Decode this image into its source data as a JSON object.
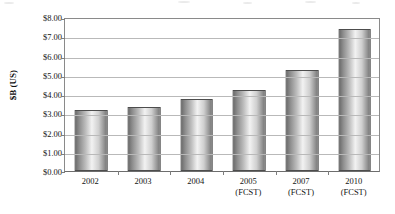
{
  "chart_data": {
    "type": "bar",
    "title": "",
    "subtitle": "",
    "xlabel": "",
    "ylabel": "$B (US)",
    "categories": [
      "2002",
      "2003",
      "2004",
      "2005",
      "2007",
      "2010"
    ],
    "category_sublabels": [
      "",
      "",
      "",
      "(FCST)",
      "(FCST)",
      "(FCST)"
    ],
    "values": [
      3.15,
      3.35,
      3.75,
      4.2,
      5.25,
      7.4
    ],
    "ylim": [
      0,
      8
    ],
    "ytick_step": 1,
    "ytick_labels": [
      "$0.00",
      "$1.00",
      "$2.00",
      "$3.00",
      "$4.00",
      "$5.00",
      "$6.00",
      "$7.00",
      "$8.00"
    ],
    "ytick_values": [
      0,
      1,
      2,
      3,
      4,
      5,
      6,
      7,
      8
    ],
    "grid": "horizontal",
    "legend": "none",
    "series": [
      {
        "name": "",
        "values": [
          3.15,
          3.35,
          3.75,
          4.2,
          5.25,
          7.4
        ]
      }
    ],
    "colors": {
      "bar_edge": "#4d4d4d",
      "bar_fill_dark": "#6e6e6e",
      "bar_fill_light": "#f2f2f2",
      "gridline": "#b9b9b9",
      "axis": "#8a8a8a",
      "text": "#141414",
      "background": "#ffffff"
    }
  }
}
